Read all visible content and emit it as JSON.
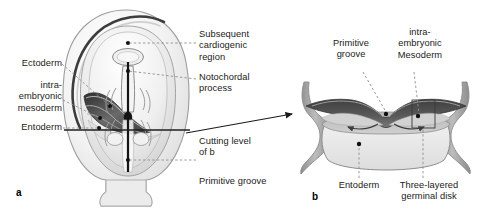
{
  "figure": {
    "title_alt": "Embryonic germ disk: dorsal view (a) and cross-section (b)",
    "panels": [
      {
        "letter": "a",
        "name": "dorsal-view-embryo"
      },
      {
        "letter": "b",
        "name": "cross-section-germinal-disk"
      }
    ]
  },
  "labels": {
    "ectoderm": "Ectoderm",
    "intraembryonic_mesoderm_a": "intra-\nembryonic\nmesoderm",
    "entoderm_a": "Entoderm",
    "subsequent_cardiogenic_region": "Subsequent\ncardiogenic\nregion",
    "notochordal_process": "Notochordal\nprocess",
    "cutting_level_of_b": "Cutting level\nof b",
    "primitive_groove_a": "Primitive groove",
    "primitive_groove_b": "Primitive\ngroove",
    "intraembryonic_mesoderm_b": "intra-\nembryonic\nMesoderm",
    "entoderm_b": "Entoderm",
    "three_layered_germinal_disk": "Three-layered\ngerminal disk"
  },
  "colors": {
    "ink": "#1a1a1a",
    "leader_line": "#8a8a8a",
    "outline": "#6d6d6d",
    "mesoderm_dark": "#4e4e4e",
    "mesoderm_mid": "#8e8e8e",
    "amnion_wall": "#9a9a9a",
    "disk_fill": "#ededed",
    "yolk_fill": "#e6e6e6",
    "background": "#ffffff",
    "dot": "#111111"
  },
  "markers": {
    "dot_count_panel_a": 6,
    "dot_count_panel_b": 3,
    "arrow_cutting_level": "arrow pointing right to panel b",
    "migration_arrows": 2,
    "highlight_box": "rectangle marking three-layered germinal disk"
  }
}
